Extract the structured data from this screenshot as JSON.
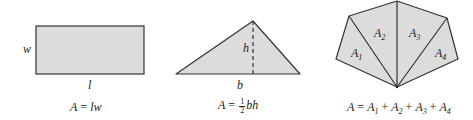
{
  "figures": {
    "rectangle": {
      "side_label_width": "w",
      "side_label_length": "l",
      "formula": {
        "lhs": "A",
        "eq": "=",
        "rhs": "lw"
      }
    },
    "triangle": {
      "height_label": "h",
      "base_label": "b",
      "formula": {
        "lhs": "A",
        "eq": "=",
        "frac_num": "1",
        "frac_den": "2",
        "rhs": "bh"
      }
    },
    "polygon": {
      "region_labels": [
        {
          "main": "A",
          "sub": "1"
        },
        {
          "main": "A",
          "sub": "2"
        },
        {
          "main": "A",
          "sub": "3"
        },
        {
          "main": "A",
          "sub": "4"
        }
      ],
      "formula": {
        "lhs": "A",
        "eq": "=",
        "terms": [
          {
            "main": "A",
            "sub": "1"
          },
          {
            "main": "A",
            "sub": "2"
          },
          {
            "main": "A",
            "sub": "3"
          },
          {
            "main": "A",
            "sub": "4"
          }
        ],
        "op": "+"
      }
    }
  },
  "colors": {
    "fill": "#dcdcdc",
    "stroke": "#333333"
  }
}
